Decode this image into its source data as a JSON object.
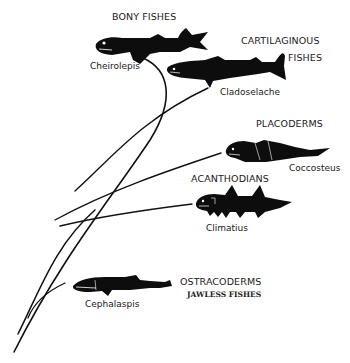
{
  "diagram": {
    "type": "phylogenetic-tree",
    "line_color": "#111111",
    "fish_color": "#0d0d0d",
    "background": "#ffffff",
    "groups": [
      {
        "id": "bony",
        "label": "BONY FISHES",
        "genus": "Cheirolepis"
      },
      {
        "id": "cartilaginous",
        "label_line1": "CARTILAGINOUS",
        "label_line2": "FISHES",
        "genus": "Cladoselache"
      },
      {
        "id": "placoderms",
        "label": "PLACODERMS",
        "genus": "Coccosteus"
      },
      {
        "id": "acanthodians",
        "label": "ACANTHODIANS",
        "genus": "Climatius"
      },
      {
        "id": "ostracoderms",
        "label": "OSTRACODERMS",
        "sublabel": "JAWLESS FISHES",
        "genus": "Cephalaspis"
      }
    ]
  }
}
